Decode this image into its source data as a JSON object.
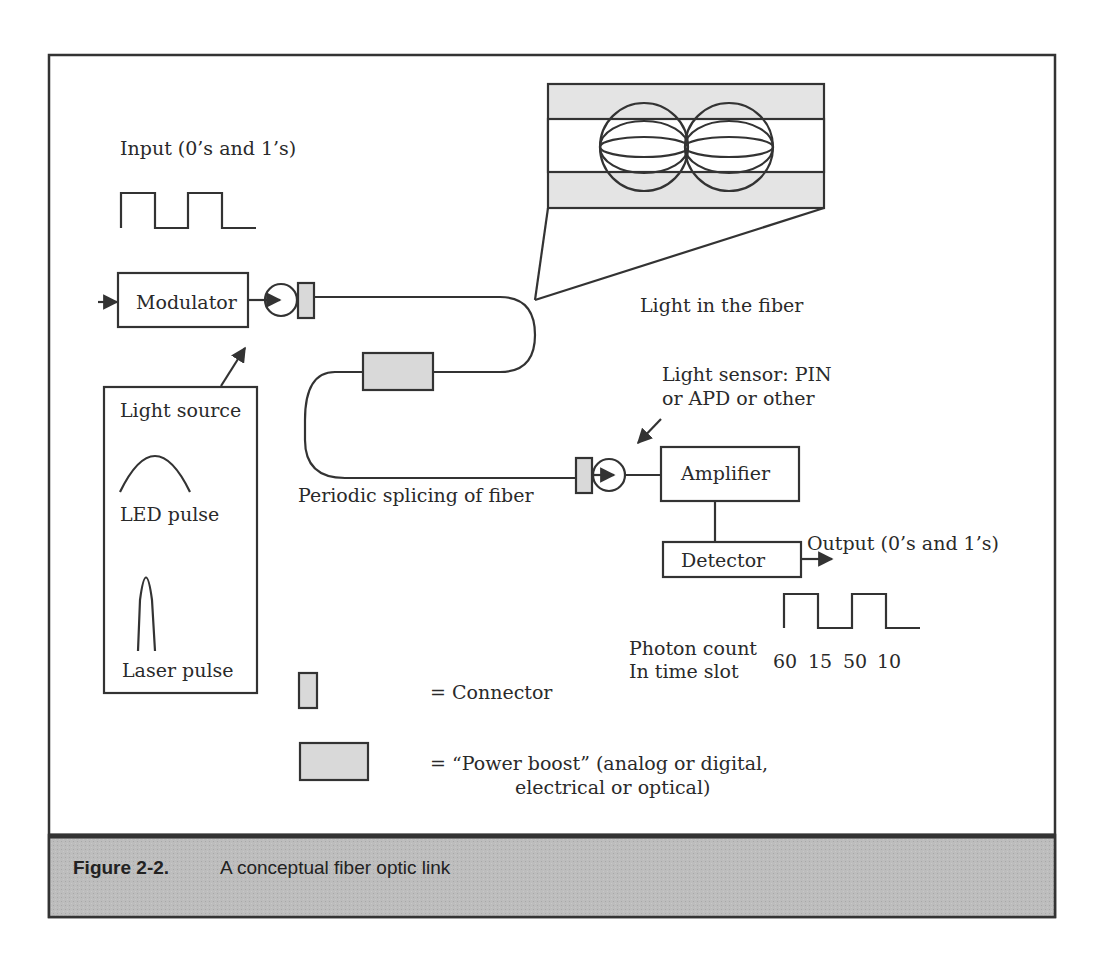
{
  "figure": {
    "number": "Figure 2-2.",
    "caption": "A conceptual fiber optic link",
    "colors": {
      "line": "#333333",
      "caption_bar": "#b8b8b8",
      "component_fill": "#d9d9d9",
      "background": "#ffffff"
    }
  },
  "input": {
    "label": "Input (0’s and 1’s)",
    "waveform": "1010"
  },
  "modulator": {
    "label": "Modulator"
  },
  "light_source": {
    "title": "Light source",
    "led_label": "LED pulse",
    "laser_label": "Laser pulse"
  },
  "fiber": {
    "zoom_label": "Light in the fiber",
    "splicing_label": "Periodic splicing of fiber"
  },
  "receiver": {
    "sensor_label_line1": "Light sensor: PIN",
    "sensor_label_line2": "or APD or other",
    "amplifier_label": "Amplifier",
    "detector_label": "Detector",
    "output_label": "Output (0’s and 1’s)",
    "photon_label_line1": "Photon count",
    "photon_label_line2": "In time slot",
    "photon_counts": [
      "60",
      "15",
      "50",
      "10"
    ]
  },
  "legend": {
    "connector": "= Connector",
    "power_boost_line1": "= “Power boost” (analog or digital,",
    "power_boost_line2": "electrical or optical)"
  }
}
